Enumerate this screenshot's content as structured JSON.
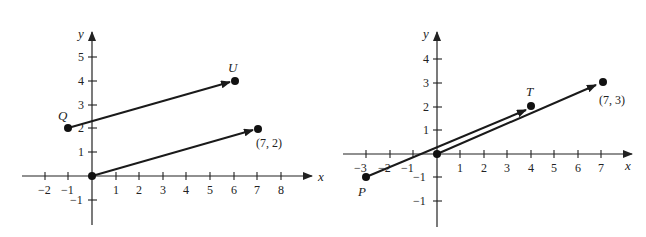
{
  "figure": {
    "left_graph": {
      "axis_labels": {
        "x": "x",
        "y": "y"
      },
      "x_ticks": [
        "−2",
        "−1",
        "1",
        "2",
        "3",
        "4",
        "5",
        "6",
        "7",
        "8"
      ],
      "y_ticks": [
        "1",
        "2",
        "3",
        "4",
        "5",
        "−1"
      ],
      "points": {
        "Q": {
          "label": "Q",
          "coords": [
            -1,
            2
          ]
        },
        "U": {
          "label": "U",
          "coords": [
            6,
            4
          ]
        },
        "origin": {
          "coords": [
            0,
            0
          ]
        },
        "end": {
          "label": "(7, 2)",
          "coords": [
            7,
            2
          ]
        }
      },
      "vectors": [
        {
          "from": "Q",
          "to": "U"
        },
        {
          "from": "origin",
          "to": "(7, 2)"
        }
      ]
    },
    "right_graph": {
      "axis_labels": {
        "x": "x",
        "y": "y"
      },
      "x_ticks": [
        "−3",
        "−2",
        "−1",
        "1",
        "2",
        "3",
        "4",
        "5",
        "6",
        "7"
      ],
      "y_ticks": [
        "1",
        "2",
        "3",
        "4",
        "−1",
        "−1"
      ],
      "points": {
        "P": {
          "label": "P",
          "coords": [
            -3,
            -1
          ]
        },
        "T": {
          "label": "T",
          "coords": [
            4,
            2
          ]
        },
        "origin": {
          "coords": [
            0,
            0
          ]
        },
        "end": {
          "label": "(7, 3)",
          "coords": [
            7,
            3
          ]
        }
      },
      "vectors": [
        {
          "from": "P",
          "to": "T"
        },
        {
          "from": "origin",
          "to": "(7, 3)"
        }
      ]
    }
  }
}
